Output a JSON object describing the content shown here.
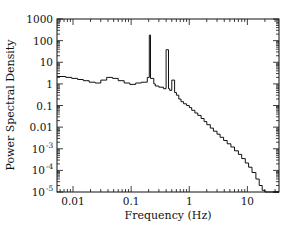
{
  "chart_data": {
    "type": "line",
    "style": "step",
    "title": "",
    "xlabel": "Frequency (Hz)",
    "ylabel": "Power Spectral Density",
    "xscale": "log",
    "yscale": "log",
    "xlim": [
      0.0053,
      35
    ],
    "ylim": [
      1e-05,
      1000
    ],
    "grid": false,
    "legend": null,
    "x_ticks": [
      {
        "value": 0.01,
        "label": "0.01"
      },
      {
        "value": 0.1,
        "label": "0.1"
      },
      {
        "value": 1,
        "label": "1"
      },
      {
        "value": 10,
        "label": "10"
      }
    ],
    "y_ticks": [
      {
        "value": 1000,
        "label": "1000",
        "sup": ""
      },
      {
        "value": 100,
        "label": "100",
        "sup": ""
      },
      {
        "value": 10,
        "label": "10",
        "sup": ""
      },
      {
        "value": 1,
        "label": "1",
        "sup": ""
      },
      {
        "value": 0.1,
        "label": "0.1",
        "sup": ""
      },
      {
        "value": 0.01,
        "label": "0.01",
        "sup": ""
      },
      {
        "value": 0.001,
        "label": "10",
        "sup": "-3"
      },
      {
        "value": 0.0001,
        "label": "10",
        "sup": "-4"
      },
      {
        "value": 1e-05,
        "label": "10",
        "sup": "-5"
      }
    ],
    "series": [
      {
        "name": "PSD",
        "x": [
          0.0053,
          0.0075,
          0.0095,
          0.012,
          0.015,
          0.019,
          0.024,
          0.03,
          0.038,
          0.048,
          0.06,
          0.076,
          0.095,
          0.12,
          0.15,
          0.19,
          0.205,
          0.215,
          0.245,
          0.26,
          0.3,
          0.36,
          0.4,
          0.44,
          0.46,
          0.5,
          0.56,
          0.6,
          0.66,
          0.72,
          0.8,
          0.9,
          1.0,
          1.1,
          1.25,
          1.4,
          1.6,
          1.8,
          2.0,
          2.3,
          2.6,
          3.0,
          3.4,
          3.9,
          4.5,
          5.2,
          6.0,
          7.0,
          8.0,
          9.2,
          10.5,
          12,
          14,
          16,
          18,
          20,
          22,
          24,
          26,
          28,
          30,
          35
        ],
        "y": [
          2.2,
          2.0,
          1.8,
          1.6,
          1.4,
          1.2,
          1.1,
          1.5,
          2.0,
          1.8,
          1.4,
          1.1,
          0.95,
          1.1,
          1.2,
          2.0,
          180,
          1.8,
          1.0,
          0.8,
          0.7,
          0.6,
          38,
          0.6,
          0.5,
          1.5,
          0.4,
          0.3,
          0.2,
          0.15,
          0.12,
          0.1,
          0.08,
          0.06,
          0.045,
          0.035,
          0.025,
          0.018,
          0.013,
          0.009,
          0.0065,
          0.0047,
          0.0034,
          0.0024,
          0.0017,
          0.0012,
          0.0008,
          0.00055,
          0.00035,
          0.00022,
          0.00014,
          8e-05,
          4e-05,
          2e-05,
          1.2e-05,
          1e-05,
          1e-05,
          1e-05,
          1e-05,
          1e-05,
          1e-05,
          1e-05
        ]
      }
    ]
  },
  "axes": {
    "x_title": "Frequency (Hz)",
    "y_title": "Power Spectral Density"
  }
}
